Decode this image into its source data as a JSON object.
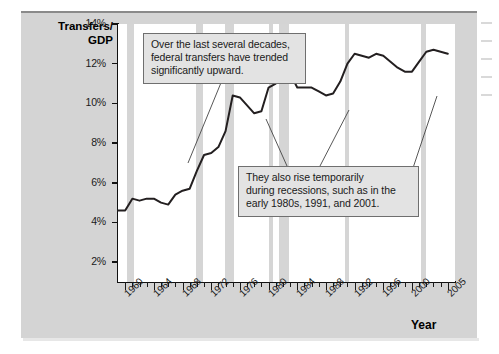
{
  "figure": {
    "y_axis_title_line1": "Transfers/",
    "y_axis_title_line2": "GDP",
    "x_axis_title": "Year"
  },
  "annotations": [
    {
      "id": "trend",
      "line1": "Over the last several decades,",
      "line2": "federal transfers have trended",
      "line3": "significantly upward."
    },
    {
      "id": "recession",
      "line1": "They also rise temporarily",
      "line2": "during recessions, such as in the",
      "line3": "early 1980s, 1991, and 2001."
    }
  ],
  "chart_data": {
    "type": "line",
    "title": "",
    "xlabel": "Year",
    "ylabel": "Transfers/GDP",
    "xlim": [
      1959,
      2006
    ],
    "ylim": [
      1.0,
      14.0
    ],
    "grid": false,
    "legend": "none",
    "ytick_labels": [
      "14%",
      "12%",
      "10%",
      "8%",
      "6%",
      "4%",
      "2%"
    ],
    "ytick_values": [
      14,
      12,
      10,
      8,
      6,
      4,
      2
    ],
    "xtick_labels": [
      "1960",
      "1964",
      "1968",
      "1972",
      "1976",
      "1980",
      "1984",
      "1988",
      "1992",
      "1996",
      "2000",
      "2005"
    ],
    "xtick_values": [
      1960,
      1964,
      1968,
      1972,
      1976,
      1980,
      1984,
      1988,
      1992,
      1996,
      2000,
      2005
    ],
    "line_color": "#231f20",
    "recession_band_color": "#d5d5d5",
    "recession_bands": [
      {
        "start": 1960.3,
        "end": 1961.2
      },
      {
        "start": 1969.9,
        "end": 1970.9
      },
      {
        "start": 1973.9,
        "end": 1975.2
      },
      {
        "start": 1980.0,
        "end": 1980.6
      },
      {
        "start": 1981.5,
        "end": 1982.9
      },
      {
        "start": 1990.6,
        "end": 1991.2
      },
      {
        "start": 2001.2,
        "end": 2001.9
      }
    ],
    "series": [
      {
        "name": "Transfers/GDP",
        "x": [
          1959,
          1960,
          1961,
          1962,
          1963,
          1964,
          1965,
          1966,
          1967,
          1968,
          1969,
          1970,
          1971,
          1972,
          1973,
          1974,
          1975,
          1976,
          1977,
          1978,
          1979,
          1980,
          1981,
          1982,
          1983,
          1984,
          1985,
          1986,
          1987,
          1988,
          1989,
          1990,
          1991,
          1992,
          1993,
          1994,
          1995,
          1996,
          1997,
          1998,
          1999,
          2000,
          2001,
          2002,
          2003,
          2004,
          2005
        ],
        "values": [
          4.6,
          4.6,
          5.2,
          5.1,
          5.2,
          5.2,
          5.0,
          4.9,
          5.4,
          5.6,
          5.7,
          6.6,
          7.4,
          7.5,
          7.8,
          8.6,
          10.4,
          10.3,
          9.9,
          9.5,
          9.6,
          10.8,
          11.0,
          11.7,
          11.5,
          10.8,
          10.8,
          10.8,
          10.6,
          10.4,
          10.5,
          11.1,
          12.0,
          12.5,
          12.4,
          12.3,
          12.5,
          12.4,
          12.1,
          11.8,
          11.6,
          11.6,
          12.1,
          12.6,
          12.7,
          12.6,
          12.5
        ]
      }
    ]
  }
}
